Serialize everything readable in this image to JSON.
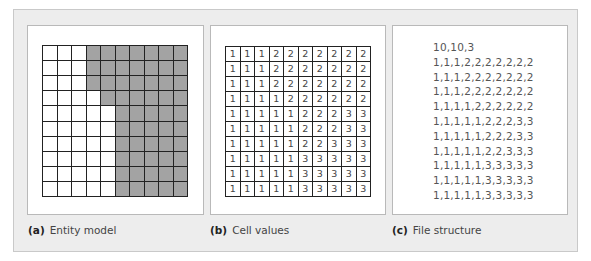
{
  "panels": {
    "a": {
      "label": "(a)",
      "title": "Entity model"
    },
    "b": {
      "label": "(b)",
      "title": "Cell values"
    },
    "c": {
      "label": "(c)",
      "title": "File structure"
    }
  },
  "colors": {
    "entity_gray": "#a3a3a3",
    "entity_white": "#ffffff",
    "grid_line": "#222222"
  },
  "grid": {
    "rows": 10,
    "cols": 10,
    "entities": 3,
    "values": [
      [
        1,
        1,
        1,
        2,
        2,
        2,
        2,
        2,
        2,
        2
      ],
      [
        1,
        1,
        1,
        2,
        2,
        2,
        2,
        2,
        2,
        2
      ],
      [
        1,
        1,
        1,
        2,
        2,
        2,
        2,
        2,
        2,
        2
      ],
      [
        1,
        1,
        1,
        1,
        2,
        2,
        2,
        2,
        2,
        2
      ],
      [
        1,
        1,
        1,
        1,
        1,
        2,
        2,
        2,
        3,
        3
      ],
      [
        1,
        1,
        1,
        1,
        1,
        2,
        2,
        2,
        3,
        3
      ],
      [
        1,
        1,
        1,
        1,
        1,
        2,
        2,
        3,
        3,
        3
      ],
      [
        1,
        1,
        1,
        1,
        1,
        3,
        3,
        3,
        3,
        3
      ],
      [
        1,
        1,
        1,
        1,
        1,
        3,
        3,
        3,
        3,
        3
      ],
      [
        1,
        1,
        1,
        1,
        1,
        3,
        3,
        3,
        3,
        3
      ]
    ]
  },
  "file": {
    "lines": [
      "10,10,3",
      "1,1,1,2,2,2,2,2,2,2",
      "1,1,1,2,2,2,2,2,2,2",
      "1,1,1,2,2,2,2,2,2,2",
      "1,1,1,1,2,2,2,2,2,2",
      "1,1,1,1,1,2,2,2,3,3",
      "1,1,1,1,1,2,2,2,3,3",
      "1,1,1,1,1,2,2,3,3,3",
      "1,1,1,1,1,3,3,3,3,3",
      "1,1,1,1,1,3,3,3,3,3",
      "1,1,1,1,1,3,3,3,3,3"
    ]
  }
}
